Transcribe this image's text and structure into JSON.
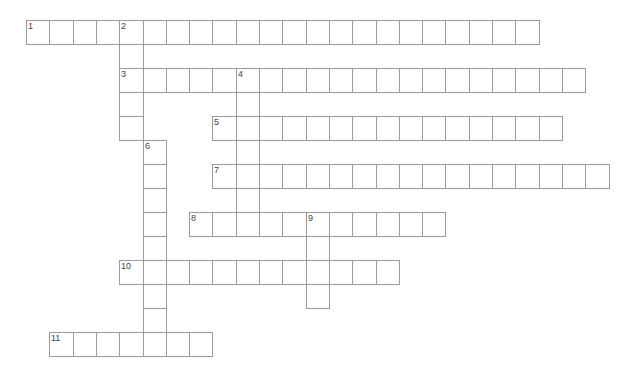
{
  "puzzle": {
    "layout": {
      "origin_x": 26,
      "origin_y": 20,
      "cell_w": 23.3,
      "cell_h": 24
    },
    "colors": {
      "grid_line": "#9a9a9a",
      "number": "#444444",
      "background": "#ffffff"
    },
    "across": [
      {
        "number": "1",
        "row": 0,
        "col": 0,
        "length": 22
      },
      {
        "number": "3",
        "row": 2,
        "col": 4,
        "length": 20
      },
      {
        "number": "5",
        "row": 4,
        "col": 8,
        "length": 15
      },
      {
        "number": "7",
        "row": 6,
        "col": 8,
        "length": 17
      },
      {
        "number": "8",
        "row": 8,
        "col": 7,
        "length": 11
      },
      {
        "number": "10",
        "row": 10,
        "col": 4,
        "length": 12
      },
      {
        "number": "11",
        "row": 13,
        "col": 1,
        "length": 7
      }
    ],
    "down": [
      {
        "number": "2",
        "row": 0,
        "col": 4,
        "length": 5
      },
      {
        "number": "4",
        "row": 2,
        "col": 9,
        "length": 7
      },
      {
        "number": "6",
        "row": 5,
        "col": 5,
        "length": 9
      },
      {
        "number": "9",
        "row": 8,
        "col": 12,
        "length": 4
      }
    ]
  }
}
